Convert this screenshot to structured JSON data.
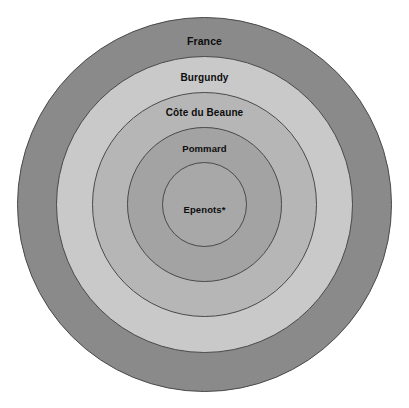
{
  "figure": {
    "type": "nested-circles",
    "background_color": "#ffffff",
    "center": {
      "x": 204.5,
      "y": 204.5
    },
    "stroke_color": "#4a4a4a",
    "stroke_width": 1,
    "label_color": "#0d0d0d"
  },
  "chart_data": {
    "type": "pie",
    "title": "",
    "subtitle": "",
    "xlabel": "",
    "ylabel": "",
    "legend_position": "none",
    "grid": false,
    "categories": [
      "France",
      "Burgundy",
      "Côte du Beaune",
      "Pommard",
      "Epenots*"
    ],
    "values": [
      187,
      148,
      112,
      77,
      42
    ],
    "series": [
      {
        "name": "radius_px",
        "values": [
          187,
          148,
          112,
          77,
          42
        ]
      }
    ]
  },
  "rings": [
    {
      "id": "ring-france",
      "label": "France",
      "level": 1,
      "radius": 187,
      "fill": "#8a8a8a",
      "label_x": 204.5,
      "label_y": 41
    },
    {
      "id": "ring-burgundy",
      "label": "Burgundy",
      "level": 2,
      "radius": 148,
      "fill": "#c9c9c9",
      "label_x": 204.5,
      "label_y": 77
    },
    {
      "id": "ring-cote-du-beaune",
      "label": "Côte du Beaune",
      "level": 3,
      "radius": 112,
      "fill": "#b6b6b6",
      "label_x": 204.5,
      "label_y": 112
    },
    {
      "id": "ring-pommard",
      "label": "Pommard",
      "level": 4,
      "radius": 77,
      "fill": "#a3a3a3",
      "label_x": 204.5,
      "label_y": 148
    },
    {
      "id": "ring-epenots",
      "label": "Epenots*",
      "level": 5,
      "radius": 42,
      "fill": "#a8a8a8",
      "label_x": 204.5,
      "label_y": 209
    }
  ]
}
